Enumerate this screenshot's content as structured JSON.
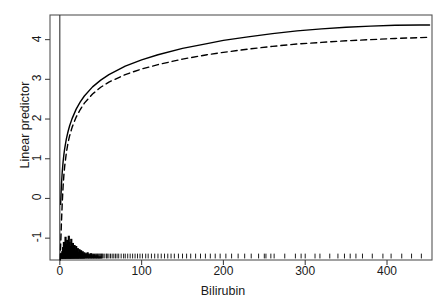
{
  "chart_data": {
    "type": "line",
    "title": "",
    "xlabel": "Bilirubin",
    "ylabel": "Linear predictor",
    "xlim": [
      -12,
      455
    ],
    "ylim": [
      -1.55,
      4.62
    ],
    "xticks": [
      0,
      100,
      200,
      300,
      400
    ],
    "yticks": [
      -1,
      0,
      1,
      2,
      3,
      4
    ],
    "xtick_labels": [
      "0",
      "100",
      "200",
      "300",
      "400"
    ],
    "ytick_labels": [
      "-1",
      "0",
      "1",
      "2",
      "3",
      "4"
    ],
    "grid": false,
    "legend": "none",
    "box": true,
    "annotations": [
      "vertical reference line at x = 0",
      "rug plot of Bilirubin observations along bottom at y = -1.45"
    ],
    "series": [
      {
        "name": "solid-curve",
        "style": "solid",
        "color": "#000000",
        "x": [
          1,
          2,
          3,
          4,
          5,
          6,
          8,
          10,
          12,
          15,
          20,
          25,
          30,
          40,
          50,
          60,
          80,
          100,
          120,
          150,
          180,
          200,
          230,
          260,
          290,
          320,
          350,
          380,
          410,
          440,
          452
        ],
        "y": [
          -0.15,
          0.35,
          0.68,
          0.92,
          1.11,
          1.26,
          1.5,
          1.68,
          1.83,
          2.01,
          2.25,
          2.43,
          2.58,
          2.81,
          2.98,
          3.12,
          3.33,
          3.49,
          3.62,
          3.78,
          3.9,
          3.98,
          4.07,
          4.15,
          4.22,
          4.27,
          4.31,
          4.34,
          4.36,
          4.37,
          4.37
        ]
      },
      {
        "name": "dashed-curve",
        "style": "dashed",
        "color": "#000000",
        "x": [
          0.5,
          1,
          2,
          3,
          4,
          5,
          6,
          8,
          10,
          12,
          15,
          20,
          25,
          30,
          40,
          50,
          60,
          80,
          100,
          120,
          150,
          180,
          200,
          230,
          260,
          290,
          320,
          350,
          380,
          410,
          440,
          452
        ],
        "y": [
          -1.55,
          -1.2,
          -0.6,
          -0.1,
          0.3,
          0.6,
          0.82,
          1.15,
          1.4,
          1.58,
          1.79,
          2.05,
          2.24,
          2.4,
          2.63,
          2.8,
          2.93,
          3.12,
          3.26,
          3.37,
          3.51,
          3.62,
          3.68,
          3.76,
          3.83,
          3.89,
          3.93,
          3.97,
          4.0,
          4.03,
          4.05,
          4.06
        ]
      }
    ],
    "rug": {
      "name": "bilirubin-rug",
      "y": -1.45,
      "values": [
        1,
        1,
        1,
        2,
        2,
        2,
        2,
        3,
        3,
        3,
        3,
        3,
        4,
        4,
        4,
        4,
        4,
        5,
        5,
        5,
        5,
        6,
        6,
        6,
        6,
        7,
        7,
        7,
        7,
        8,
        8,
        8,
        9,
        9,
        9,
        10,
        10,
        10,
        11,
        11,
        11,
        12,
        12,
        12,
        13,
        13,
        13,
        14,
        14,
        14,
        15,
        15,
        16,
        16,
        16,
        17,
        17,
        18,
        18,
        19,
        19,
        20,
        20,
        21,
        21,
        22,
        22,
        23,
        23,
        24,
        25,
        25,
        26,
        27,
        27,
        28,
        29,
        30,
        30,
        31,
        32,
        33,
        34,
        35,
        36,
        37,
        38,
        39,
        40,
        41,
        42,
        43,
        44,
        45,
        46,
        47,
        48,
        49,
        50,
        51,
        52,
        53,
        55,
        57,
        58,
        60,
        62,
        64,
        66,
        68,
        70,
        72,
        75,
        78,
        80,
        83,
        86,
        89,
        92,
        95,
        98,
        101,
        105,
        108,
        112,
        116,
        120,
        124,
        128,
        132,
        136,
        140,
        145,
        150,
        155,
        160,
        166,
        172,
        178,
        184,
        190,
        196,
        203,
        210,
        218,
        226,
        234,
        243,
        252,
        262,
        250,
        258,
        275,
        288,
        295,
        300,
        312,
        318,
        330,
        340,
        348,
        355,
        362,
        370,
        382,
        395,
        405,
        418,
        430,
        442
      ]
    },
    "histogram_spike": {
      "name": "density-spike",
      "x_range": [
        0,
        55
      ],
      "description": "dense black spike histogram rising from baseline near low Bilirubin values",
      "bars": [
        {
          "x": 2,
          "h": 0.04
        },
        {
          "x": 3,
          "h": 0.07
        },
        {
          "x": 4,
          "h": 0.11
        },
        {
          "x": 5,
          "h": 0.16
        },
        {
          "x": 6,
          "h": 0.1
        },
        {
          "x": 7,
          "h": 0.21
        },
        {
          "x": 8,
          "h": 0.14
        },
        {
          "x": 9,
          "h": 0.18
        },
        {
          "x": 10,
          "h": 0.13
        },
        {
          "x": 11,
          "h": 0.22
        },
        {
          "x": 12,
          "h": 0.16
        },
        {
          "x": 13,
          "h": 0.12
        },
        {
          "x": 14,
          "h": 0.19
        },
        {
          "x": 15,
          "h": 0.1
        },
        {
          "x": 16,
          "h": 0.15
        },
        {
          "x": 17,
          "h": 0.09
        },
        {
          "x": 18,
          "h": 0.13
        },
        {
          "x": 19,
          "h": 0.08
        },
        {
          "x": 20,
          "h": 0.12
        },
        {
          "x": 21,
          "h": 0.07
        },
        {
          "x": 22,
          "h": 0.1
        },
        {
          "x": 23,
          "h": 0.06
        },
        {
          "x": 24,
          "h": 0.09
        },
        {
          "x": 25,
          "h": 0.05
        },
        {
          "x": 26,
          "h": 0.08
        },
        {
          "x": 27,
          "h": 0.05
        },
        {
          "x": 28,
          "h": 0.07
        },
        {
          "x": 29,
          "h": 0.04
        },
        {
          "x": 30,
          "h": 0.06
        },
        {
          "x": 32,
          "h": 0.05
        },
        {
          "x": 34,
          "h": 0.06
        },
        {
          "x": 36,
          "h": 0.04
        },
        {
          "x": 38,
          "h": 0.05
        },
        {
          "x": 40,
          "h": 0.03
        },
        {
          "x": 42,
          "h": 0.04
        },
        {
          "x": 44,
          "h": 0.03
        },
        {
          "x": 46,
          "h": 0.03
        },
        {
          "x": 48,
          "h": 0.02
        },
        {
          "x": 50,
          "h": 0.02
        }
      ]
    }
  }
}
